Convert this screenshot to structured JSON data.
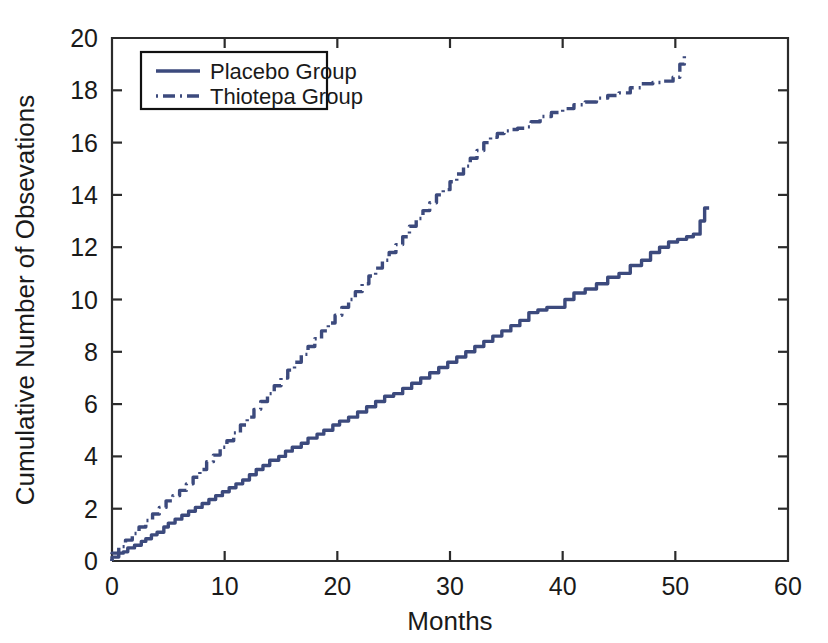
{
  "chart_data": {
    "type": "line",
    "title": "",
    "xlabel": "Months",
    "ylabel": "Cumulative Number of Obsevations",
    "xlim": [
      0,
      60
    ],
    "ylim": [
      0,
      20
    ],
    "xticks": [
      0,
      10,
      20,
      30,
      40,
      50,
      60
    ],
    "yticks": [
      0,
      2,
      4,
      6,
      8,
      10,
      12,
      14,
      16,
      18,
      20
    ],
    "xtick_labels": [
      "0",
      "10",
      "20",
      "30",
      "40",
      "50",
      "60"
    ],
    "ytick_labels": [
      "0",
      "2",
      "4",
      "6",
      "8",
      "10",
      "12",
      "14",
      "16",
      "18",
      "20"
    ],
    "grid": false,
    "legend_position": "upper-left-inset",
    "line_color": "#3c4a7d",
    "series": [
      {
        "name": "Placebo Group",
        "style": "solid",
        "color": "#3c4a7d",
        "x": [
          0.0,
          0.6,
          1.0,
          1.4,
          2.0,
          2.6,
          3.0,
          3.5,
          4.0,
          4.6,
          5.0,
          5.6,
          6.2,
          6.8,
          7.4,
          8.0,
          8.6,
          9.2,
          9.8,
          10.4,
          11.0,
          11.6,
          12.2,
          12.8,
          13.4,
          14.0,
          14.8,
          15.4,
          16.0,
          16.8,
          17.4,
          18.2,
          18.8,
          19.6,
          20.2,
          21.0,
          21.8,
          22.6,
          23.4,
          24.2,
          25.0,
          25.8,
          26.6,
          27.4,
          28.2,
          29.0,
          29.8,
          30.6,
          31.4,
          32.2,
          33.0,
          33.8,
          34.6,
          35.4,
          36.2,
          37.0,
          37.8,
          38.6,
          39.4,
          40.2,
          41.0,
          42.0,
          43.0,
          44.0,
          45.0,
          46.0,
          47.0,
          47.8,
          48.6,
          49.4,
          50.2,
          51.0,
          51.6,
          52.2,
          52.6,
          53.0
        ],
        "y": [
          0.0,
          0.15,
          0.3,
          0.35,
          0.5,
          0.6,
          0.75,
          0.85,
          1.0,
          1.1,
          1.3,
          1.45,
          1.6,
          1.75,
          1.9,
          2.05,
          2.2,
          2.35,
          2.5,
          2.65,
          2.8,
          2.95,
          3.1,
          3.3,
          3.5,
          3.65,
          3.85,
          4.0,
          4.2,
          4.35,
          4.5,
          4.7,
          4.85,
          5.0,
          5.2,
          5.35,
          5.5,
          5.7,
          5.9,
          6.1,
          6.3,
          6.4,
          6.6,
          6.8,
          7.0,
          7.2,
          7.4,
          7.6,
          7.8,
          8.0,
          8.2,
          8.4,
          8.6,
          8.8,
          9.0,
          9.2,
          9.5,
          9.6,
          9.7,
          9.7,
          10.0,
          10.25,
          10.4,
          10.6,
          10.85,
          11.0,
          11.3,
          11.5,
          11.8,
          12.0,
          12.2,
          12.3,
          12.4,
          12.5,
          13.0,
          13.5
        ]
      },
      {
        "name": "Thiotepa Group",
        "style": "dashdot",
        "color": "#3c4a7d",
        "x": [
          0.0,
          0.6,
          1.2,
          1.8,
          2.4,
          3.0,
          3.6,
          4.2,
          4.8,
          5.4,
          6.0,
          6.6,
          7.2,
          7.8,
          8.4,
          9.0,
          9.6,
          10.2,
          10.8,
          11.4,
          12.0,
          12.6,
          13.2,
          13.8,
          14.4,
          15.0,
          15.6,
          16.2,
          16.8,
          17.4,
          18.0,
          18.6,
          19.2,
          19.8,
          20.4,
          21.0,
          21.6,
          22.2,
          22.8,
          23.4,
          24.0,
          24.6,
          25.2,
          25.8,
          26.4,
          27.0,
          27.6,
          28.2,
          28.8,
          29.4,
          30.0,
          30.6,
          31.2,
          31.8,
          32.4,
          33.0,
          33.6,
          34.2,
          34.8,
          35.4,
          36.0,
          36.6,
          37.2,
          38.0,
          39.0,
          40.0,
          41.0,
          42.0,
          43.0,
          44.0,
          45.0,
          46.0,
          47.0,
          48.0,
          49.0,
          49.8,
          50.4,
          50.8,
          51.0
        ],
        "y": [
          0.0,
          0.3,
          0.55,
          0.8,
          1.05,
          1.3,
          1.55,
          1.8,
          2.05,
          2.3,
          2.5,
          2.7,
          2.95,
          3.2,
          3.5,
          3.8,
          4.05,
          4.35,
          4.6,
          4.9,
          5.2,
          5.5,
          5.8,
          6.1,
          6.4,
          6.7,
          7.0,
          7.3,
          7.6,
          7.9,
          8.2,
          8.5,
          8.8,
          9.1,
          9.4,
          9.7,
          10.0,
          10.3,
          10.6,
          10.9,
          11.2,
          11.5,
          11.8,
          12.1,
          12.4,
          12.8,
          13.1,
          13.4,
          13.7,
          14.0,
          14.2,
          14.5,
          14.8,
          15.1,
          15.4,
          15.7,
          16.0,
          16.2,
          16.35,
          16.45,
          16.5,
          16.55,
          16.6,
          16.8,
          17.0,
          17.15,
          17.3,
          17.45,
          17.55,
          17.7,
          17.8,
          17.9,
          18.1,
          18.25,
          18.3,
          18.35,
          18.5,
          19.0,
          19.35
        ]
      }
    ]
  },
  "legend": {
    "items": [
      {
        "label": "Placebo Group",
        "style": "solid"
      },
      {
        "label": "Thiotepa Group",
        "style": "dashdot"
      }
    ]
  }
}
